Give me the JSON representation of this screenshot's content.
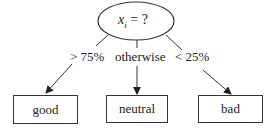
{
  "diagram": {
    "type": "decision-tree",
    "root": {
      "variable": "x",
      "subscript": "i",
      "question_suffix": " = ?"
    },
    "edges": [
      {
        "label": "> 75%",
        "target": "good"
      },
      {
        "label": "otherwise",
        "target": "neutral"
      },
      {
        "label": "< 25%",
        "target": "bad"
      }
    ],
    "leaves": [
      {
        "label": "good"
      },
      {
        "label": "neutral"
      },
      {
        "label": "bad"
      }
    ],
    "colors": {
      "stroke": "#333333",
      "text": "#222222",
      "background": "#ffffff"
    }
  }
}
